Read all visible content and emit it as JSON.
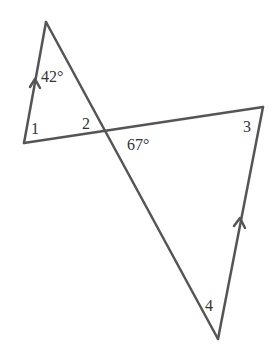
{
  "diagram": {
    "type": "geometry-crossed-triangles",
    "line_color": "#555555",
    "vertices": {
      "top": [
        46,
        22
      ],
      "left": [
        24,
        143
      ],
      "right": [
        263,
        107
      ],
      "bottom": [
        218,
        339
      ],
      "intersection": [
        105,
        131
      ]
    },
    "labels": {
      "angle_top": "42°",
      "angle_1": "1",
      "angle_2": "2",
      "angle_67": "67°",
      "angle_3": "3",
      "angle_4": "4"
    },
    "parallel_marks": [
      "left segment (top→left)",
      "right segment (bottom→right)"
    ]
  }
}
